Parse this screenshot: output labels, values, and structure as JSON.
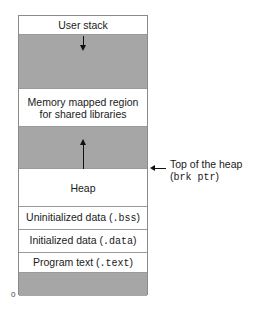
{
  "diagram": {
    "regions": [
      {
        "id": "user-stack",
        "label": "User stack",
        "shaded": false
      },
      {
        "id": "stack-growth-gap",
        "label": "",
        "shaded": true,
        "arrow": "down"
      },
      {
        "id": "mmap",
        "label_line1": "Memory mapped region",
        "label_line2": "for shared libraries",
        "shaded": false
      },
      {
        "id": "heap-growth-gap",
        "label": "",
        "shaded": true,
        "arrow": "up"
      },
      {
        "id": "heap",
        "label": "Heap",
        "shaded": false
      },
      {
        "id": "bss",
        "label": "Uninitialized data (",
        "code": ".bss",
        "label_end": ")",
        "shaded": false
      },
      {
        "id": "data",
        "label": "Initialized data (",
        "code": ".data",
        "label_end": ")",
        "shaded": false
      },
      {
        "id": "text",
        "label": "Program text (",
        "code": ".text",
        "label_end": ")",
        "shaded": false
      },
      {
        "id": "reserved",
        "label": "",
        "shaded": true
      }
    ],
    "annotation": {
      "line1": "Top of the heap",
      "line2_open": "(",
      "line2_code": "brk ptr",
      "line2_close": ")"
    },
    "address_label": "0",
    "colors": {
      "shaded": "#a6a6a6",
      "border": "#8a8a8a",
      "text": "#1a1a1a"
    }
  }
}
